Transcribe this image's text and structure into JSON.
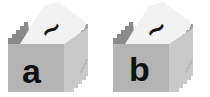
{
  "diagram": {
    "type": "card-file-boxes",
    "colors": {
      "front": "#b4b4b4",
      "side": "#c9c9c9",
      "side_steps": "#a8a8a8",
      "card": "#f2f2f2",
      "back_steps": "#8a8a8a",
      "text": "#111111"
    },
    "boxes": [
      {
        "label": "a",
        "card_glyph": "∼"
      },
      {
        "label": "b",
        "card_glyph": "∼"
      }
    ]
  }
}
